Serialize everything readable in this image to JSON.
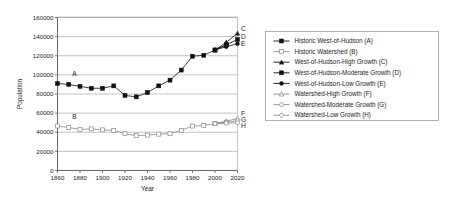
{
  "chart_data": {
    "type": "line",
    "title": "",
    "xlabel": "Year",
    "ylabel": "Population",
    "xlim": [
      1860,
      2020
    ],
    "ylim": [
      0,
      160000
    ],
    "xticks": [
      1860,
      1880,
      1900,
      1920,
      1940,
      1960,
      1980,
      2000,
      2020
    ],
    "yticks": [
      0,
      20000,
      40000,
      60000,
      80000,
      100000,
      120000,
      140000,
      160000
    ],
    "grid": "horizontal",
    "legend_position": "right",
    "series": [
      {
        "name": "Historic West-of-Hudson (A)",
        "key": "A",
        "marker": "filled-square",
        "color": "#111111",
        "x": [
          1860,
          1870,
          1880,
          1890,
          1900,
          1910,
          1920,
          1930,
          1940,
          1950,
          1960,
          1970,
          1980,
          1990,
          2000,
          2010
        ],
        "values": [
          91000,
          90000,
          88000,
          86000,
          86000,
          88500,
          78500,
          77000,
          81500,
          88500,
          94500,
          105000,
          119500,
          120500,
          126000,
          131500
        ]
      },
      {
        "name": "Historic Watershed (B)",
        "key": "B",
        "marker": "hollow-square",
        "color": "#8a8a8a",
        "x": [
          1860,
          1870,
          1880,
          1890,
          1900,
          1910,
          1920,
          1930,
          1940,
          1950,
          1960,
          1970,
          1980,
          1990,
          2000,
          2010
        ],
        "values": [
          46500,
          45000,
          43000,
          43500,
          42500,
          42000,
          38500,
          36500,
          37000,
          38000,
          38500,
          42000,
          46500,
          47000,
          49000,
          50500
        ]
      },
      {
        "name": "West-of-Hudson-High Growth (C)",
        "key": "C",
        "marker": "filled-triangle",
        "color": "#111111",
        "x": [
          2000,
          2010,
          2020
        ],
        "values": [
          126000,
          134000,
          143500
        ]
      },
      {
        "name": "West-of-Hudson-Moderate Growth (D)",
        "key": "D",
        "marker": "filled-square",
        "color": "#111111",
        "x": [
          2000,
          2010,
          2020
        ],
        "values": [
          126000,
          131500,
          137000
        ]
      },
      {
        "name": "West-of-Hudson-Low Growth (E)",
        "key": "E",
        "marker": "filled-circle",
        "color": "#111111",
        "x": [
          2000,
          2010,
          2020
        ],
        "values": [
          126000,
          129500,
          132500
        ]
      },
      {
        "name": "Watershed-High Growth (F)",
        "key": "F",
        "marker": "hollow-triangle",
        "color": "#8a8a8a",
        "x": [
          2000,
          2010,
          2020
        ],
        "values": [
          49000,
          51500,
          54500
        ]
      },
      {
        "name": "Watershed-Moderate Growth (G)",
        "key": "G",
        "marker": "hollow-circle",
        "color": "#8a8a8a",
        "x": [
          2000,
          2010,
          2020
        ],
        "values": [
          49000,
          50500,
          52000
        ]
      },
      {
        "name": "Watershed-Low Growth (H)",
        "key": "H",
        "marker": "hollow-circle",
        "color": "#8a8a8a",
        "x": [
          2000,
          2010,
          2020
        ],
        "values": [
          49000,
          49500,
          50000
        ]
      }
    ],
    "inline_labels": [
      {
        "text": "A",
        "x": 1875,
        "y": 99000
      },
      {
        "text": "B",
        "x": 1875,
        "y": 53500
      },
      {
        "text": "C",
        "x": 2023,
        "y": 145500
      },
      {
        "text": "D",
        "x": 2023,
        "y": 137500
      },
      {
        "text": "E",
        "x": 2023,
        "y": 130500
      },
      {
        "text": "F",
        "x": 2023,
        "y": 56500
      },
      {
        "text": "G",
        "x": 2023,
        "y": 50500
      },
      {
        "text": "H",
        "x": 2023,
        "y": 44500
      }
    ]
  },
  "axes": {
    "ylabel": "Population",
    "xlabel": "Year",
    "ytick_labels": [
      "0",
      "20000",
      "40000",
      "60000",
      "80000",
      "100000",
      "120000",
      "140000",
      "160000"
    ],
    "xtick_labels": [
      "1860",
      "1880",
      "1900",
      "1920",
      "1940",
      "1960",
      "1980",
      "2000",
      "2020"
    ]
  },
  "legend": {
    "items": [
      {
        "label": "Historic West-of-Hudson (A)"
      },
      {
        "label": "Historic Watershed (B)"
      },
      {
        "label": "West-of-Hudson-High Growth (C)"
      },
      {
        "label": "West-of-Hudson-Moderate Growth (D)"
      },
      {
        "label": "West-of-Hudson-Low Growth (E)"
      },
      {
        "label": "Watershed-High Growth (F)"
      },
      {
        "label": "Watershed-Moderate Growth (G)"
      },
      {
        "label": "Watershed-Low Growth (H)"
      }
    ]
  },
  "colors": {
    "dark_series": "#111111",
    "light_series": "#8a8a8a",
    "grid": "#9a9a9a",
    "axis": "#555555",
    "legend_border": "#8f8f8f",
    "background": "#ffffff"
  }
}
